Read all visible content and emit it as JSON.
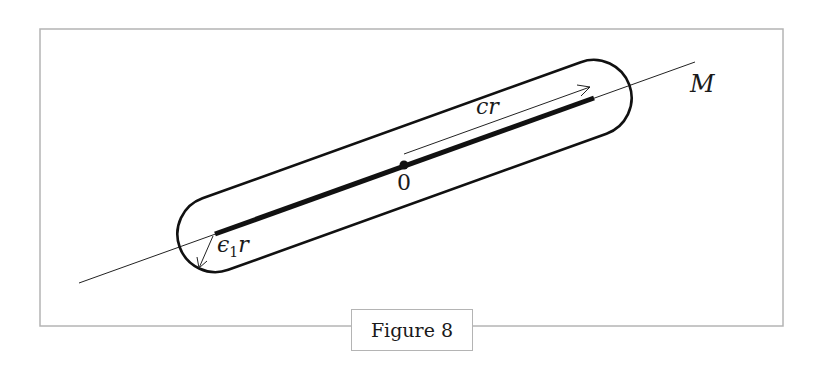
{
  "figure": {
    "caption": "Figure 8",
    "labels": {
      "origin": "0",
      "manifold": "M",
      "half_length": "cr",
      "radius_eps": "ϵ",
      "radius_sub": "1",
      "radius_r": "r"
    },
    "colors": {
      "frame": "#b4b4b4",
      "ink": "#111111"
    }
  }
}
